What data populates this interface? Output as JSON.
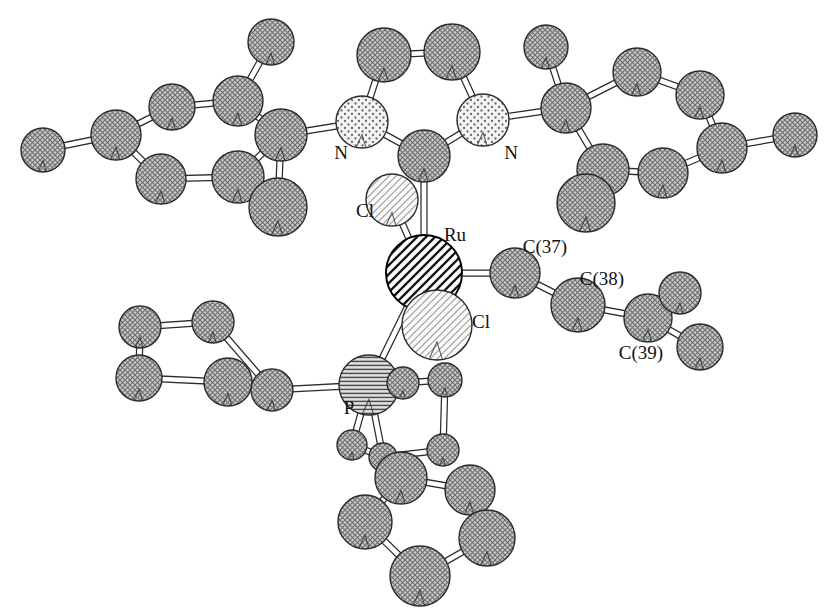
{
  "figure": {
    "kind": "ortep-crystal-structure-diagram",
    "background_color": "#ffffff",
    "width": 831,
    "height": 615
  },
  "palette": {
    "carbon_fill": "#b4b4b4",
    "carbon_stroke": "#2b2b2b",
    "nitrogen_fill": "#f0f0f0",
    "nitrogen_stroke": "#2b2b2b",
    "chlorine_fill": "#f2f2f2",
    "chlorine_stroke": "#2b2b2b",
    "ruthenium_fill": "#ffffff",
    "ruthenium_stroke": "#000000",
    "phosphorus_fill": "#cfcfcf",
    "phosphorus_stroke": "#2b2b2b",
    "bond_fill": "#ffffff",
    "bond_stroke": "#2b2b2b",
    "label_color": "#111111"
  },
  "labels": [
    {
      "name": "label-N-left",
      "text": "N",
      "x": 341,
      "y": 155,
      "anchor": "middle"
    },
    {
      "name": "label-N-right",
      "text": "N",
      "x": 511,
      "y": 155,
      "anchor": "middle"
    },
    {
      "name": "label-Cl-upper",
      "text": "Cl",
      "x": 365,
      "y": 213,
      "anchor": "middle"
    },
    {
      "name": "label-Ru",
      "text": "Ru",
      "x": 455,
      "y": 237,
      "anchor": "middle"
    },
    {
      "name": "label-Cl-lower",
      "text": "Cl",
      "x": 481,
      "y": 324,
      "anchor": "middle"
    },
    {
      "name": "label-C37",
      "text": "C(37)",
      "x": 545,
      "y": 249,
      "anchor": "middle"
    },
    {
      "name": "label-C38",
      "text": "C(38)",
      "x": 602,
      "y": 281,
      "anchor": "middle"
    },
    {
      "name": "label-C39",
      "text": "C(39)",
      "x": 641,
      "y": 355,
      "anchor": "middle"
    },
    {
      "name": "label-P",
      "text": "P",
      "x": 349,
      "y": 410,
      "anchor": "middle"
    }
  ],
  "atoms": [
    {
      "id": "C1",
      "element": "C",
      "x": 43,
      "y": 150,
      "r": 22
    },
    {
      "id": "C2",
      "element": "C",
      "x": 116,
      "y": 135,
      "r": 25
    },
    {
      "id": "C3",
      "element": "C",
      "x": 172,
      "y": 107,
      "r": 23
    },
    {
      "id": "C4",
      "element": "C",
      "x": 238,
      "y": 101,
      "r": 25
    },
    {
      "id": "C5",
      "element": "C",
      "x": 271,
      "y": 42,
      "r": 23
    },
    {
      "id": "C6",
      "element": "C",
      "x": 281,
      "y": 135,
      "r": 26
    },
    {
      "id": "C7",
      "element": "C",
      "x": 161,
      "y": 179,
      "r": 25
    },
    {
      "id": "C8",
      "element": "C",
      "x": 238,
      "y": 177,
      "r": 26
    },
    {
      "id": "C9",
      "element": "C",
      "x": 278,
      "y": 207,
      "r": 29
    },
    {
      "id": "N1",
      "element": "N",
      "x": 362,
      "y": 122,
      "r": 26
    },
    {
      "id": "N2",
      "element": "N",
      "x": 483,
      "y": 120,
      "r": 26
    },
    {
      "id": "C10",
      "element": "C",
      "x": 384,
      "y": 55,
      "r": 27
    },
    {
      "id": "C11",
      "element": "C",
      "x": 452,
      "y": 52,
      "r": 28
    },
    {
      "id": "C12",
      "element": "C",
      "x": 424,
      "y": 156,
      "r": 26
    },
    {
      "id": "C13",
      "element": "C",
      "x": 566,
      "y": 108,
      "r": 25
    },
    {
      "id": "C14",
      "element": "C",
      "x": 546,
      "y": 47,
      "r": 22
    },
    {
      "id": "C15",
      "element": "C",
      "x": 637,
      "y": 72,
      "r": 24
    },
    {
      "id": "C16",
      "element": "C",
      "x": 700,
      "y": 95,
      "r": 24
    },
    {
      "id": "C17",
      "element": "C",
      "x": 722,
      "y": 148,
      "r": 25
    },
    {
      "id": "C18",
      "element": "C",
      "x": 795,
      "y": 135,
      "r": 22
    },
    {
      "id": "C19",
      "element": "C",
      "x": 663,
      "y": 173,
      "r": 25
    },
    {
      "id": "C20",
      "element": "C",
      "x": 603,
      "y": 170,
      "r": 26
    },
    {
      "id": "C21",
      "element": "C",
      "x": 586,
      "y": 203,
      "r": 29
    },
    {
      "id": "Cl1",
      "element": "Cl",
      "x": 392,
      "y": 200,
      "r": 26
    },
    {
      "id": "Ru",
      "element": "Ru",
      "x": 424,
      "y": 273,
      "r": 38
    },
    {
      "id": "Cl2",
      "element": "Cl",
      "x": 437,
      "y": 325,
      "r": 35
    },
    {
      "id": "C37",
      "element": "C",
      "x": 515,
      "y": 273,
      "r": 25
    },
    {
      "id": "C38",
      "element": "C",
      "x": 578,
      "y": 305,
      "r": 27
    },
    {
      "id": "C39",
      "element": "C",
      "x": 648,
      "y": 318,
      "r": 24
    },
    {
      "id": "C40",
      "element": "C",
      "x": 680,
      "y": 293,
      "r": 21
    },
    {
      "id": "C41",
      "element": "C",
      "x": 700,
      "y": 347,
      "r": 23
    },
    {
      "id": "P",
      "element": "P",
      "x": 369,
      "y": 385,
      "r": 30
    },
    {
      "id": "C22",
      "element": "C",
      "x": 140,
      "y": 327,
      "r": 21
    },
    {
      "id": "C23",
      "element": "C",
      "x": 213,
      "y": 322,
      "r": 21
    },
    {
      "id": "C24",
      "element": "C",
      "x": 139,
      "y": 378,
      "r": 23
    },
    {
      "id": "C25",
      "element": "C",
      "x": 228,
      "y": 382,
      "r": 24
    },
    {
      "id": "C26",
      "element": "C",
      "x": 272,
      "y": 390,
      "r": 21
    },
    {
      "id": "C27",
      "element": "C",
      "x": 403,
      "y": 383,
      "r": 16
    },
    {
      "id": "C28",
      "element": "C",
      "x": 445,
      "y": 380,
      "r": 17
    },
    {
      "id": "C29",
      "element": "C",
      "x": 443,
      "y": 450,
      "r": 16
    },
    {
      "id": "C30",
      "element": "C",
      "x": 352,
      "y": 445,
      "r": 15
    },
    {
      "id": "C31",
      "element": "C",
      "x": 383,
      "y": 457,
      "r": 14
    },
    {
      "id": "C32",
      "element": "C",
      "x": 401,
      "y": 478,
      "r": 26
    },
    {
      "id": "C33",
      "element": "C",
      "x": 470,
      "y": 490,
      "r": 25
    },
    {
      "id": "C34",
      "element": "C",
      "x": 365,
      "y": 522,
      "r": 27
    },
    {
      "id": "C35",
      "element": "C",
      "x": 487,
      "y": 538,
      "r": 28
    },
    {
      "id": "C36",
      "element": "C",
      "x": 420,
      "y": 576,
      "r": 30
    }
  ],
  "bonds": [
    {
      "a": "C1",
      "b": "C2"
    },
    {
      "a": "C2",
      "b": "C3"
    },
    {
      "a": "C3",
      "b": "C4"
    },
    {
      "a": "C4",
      "b": "C5"
    },
    {
      "a": "C4",
      "b": "C6"
    },
    {
      "a": "C2",
      "b": "C7"
    },
    {
      "a": "C7",
      "b": "C8"
    },
    {
      "a": "C8",
      "b": "C6"
    },
    {
      "a": "C6",
      "b": "C9"
    },
    {
      "a": "C6",
      "b": "N1"
    },
    {
      "a": "N1",
      "b": "C10"
    },
    {
      "a": "C10",
      "b": "C11"
    },
    {
      "a": "C11",
      "b": "N2"
    },
    {
      "a": "N1",
      "b": "C12"
    },
    {
      "a": "C12",
      "b": "N2"
    },
    {
      "a": "N2",
      "b": "C13"
    },
    {
      "a": "C13",
      "b": "C14"
    },
    {
      "a": "C13",
      "b": "C15"
    },
    {
      "a": "C15",
      "b": "C16"
    },
    {
      "a": "C16",
      "b": "C17"
    },
    {
      "a": "C17",
      "b": "C18"
    },
    {
      "a": "C17",
      "b": "C19"
    },
    {
      "a": "C19",
      "b": "C20"
    },
    {
      "a": "C20",
      "b": "C13"
    },
    {
      "a": "C20",
      "b": "C21"
    },
    {
      "a": "C12",
      "b": "Ru"
    },
    {
      "a": "Cl1",
      "b": "Ru"
    },
    {
      "a": "Ru",
      "b": "Cl2"
    },
    {
      "a": "Ru",
      "b": "C37"
    },
    {
      "a": "Ru",
      "b": "P"
    },
    {
      "a": "C37",
      "b": "C38"
    },
    {
      "a": "C38",
      "b": "C39"
    },
    {
      "a": "C39",
      "b": "C40"
    },
    {
      "a": "C39",
      "b": "C41"
    },
    {
      "a": "C22",
      "b": "C23"
    },
    {
      "a": "C22",
      "b": "C24"
    },
    {
      "a": "C24",
      "b": "C25"
    },
    {
      "a": "C23",
      "b": "C26"
    },
    {
      "a": "C25",
      "b": "C26"
    },
    {
      "a": "C26",
      "b": "P"
    },
    {
      "a": "P",
      "b": "C27"
    },
    {
      "a": "P",
      "b": "C30"
    },
    {
      "a": "P",
      "b": "C31"
    },
    {
      "a": "C27",
      "b": "C28"
    },
    {
      "a": "C28",
      "b": "C29"
    },
    {
      "a": "C29",
      "b": "C31"
    },
    {
      "a": "C30",
      "b": "C31"
    },
    {
      "a": "C31",
      "b": "C32"
    },
    {
      "a": "C32",
      "b": "C33"
    },
    {
      "a": "C32",
      "b": "C34"
    },
    {
      "a": "C33",
      "b": "C35"
    },
    {
      "a": "C34",
      "b": "C36"
    },
    {
      "a": "C35",
      "b": "C36"
    }
  ]
}
